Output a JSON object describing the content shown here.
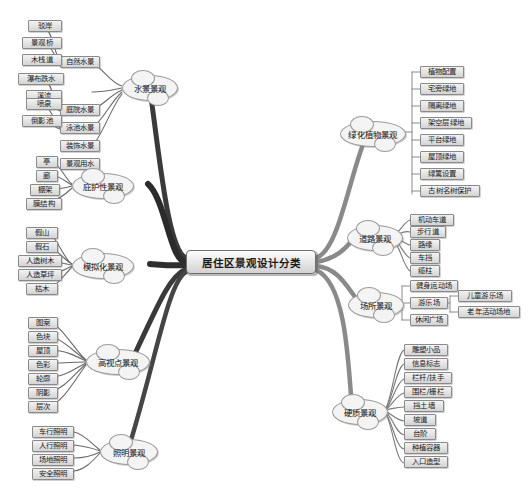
{
  "diagram": {
    "title": "居住区景观设计分类",
    "type": "mind-map",
    "colors": {
      "background": "#ffffff",
      "node_fill": "#e6e6e6",
      "node_border": "#8a8a8a",
      "branch_stroke": "#555555",
      "central_fill": "#e8e8e8"
    }
  },
  "central": {
    "label": "居住区景观设计分类"
  },
  "branches": {
    "water": {
      "label": "水景景观",
      "children": [
        {
          "label": "自然水景",
          "children": [
            {
              "label": "驳岸"
            },
            {
              "label": "景观桥"
            },
            {
              "label": "木栈道"
            }
          ]
        },
        {
          "label": "庭院水景",
          "children": [
            {
              "label": "瀑布跌水"
            },
            {
              "label": "溪流"
            }
          ]
        },
        {
          "label": "泳池水景",
          "children": []
        },
        {
          "label": "装饰水景",
          "children": [
            {
              "label": "喷泉"
            },
            {
              "label": "倒影池"
            }
          ]
        },
        {
          "label": "景观用水",
          "children": []
        }
      ]
    },
    "shelter": {
      "label": "庇护性景观",
      "children": [
        {
          "label": "亭"
        },
        {
          "label": "廊"
        },
        {
          "label": "棚架"
        },
        {
          "label": "膜结构"
        }
      ]
    },
    "simulation": {
      "label": "模拟化景观",
      "children": [
        {
          "label": "假山"
        },
        {
          "label": "假石"
        },
        {
          "label": "人造树木"
        },
        {
          "label": "人造草坪"
        },
        {
          "label": "枯木"
        }
      ]
    },
    "highview": {
      "label": "高视点景观",
      "children": [
        {
          "label": "图案"
        },
        {
          "label": "色块"
        },
        {
          "label": "屋顶"
        },
        {
          "label": "色彩"
        },
        {
          "label": "轮廓"
        },
        {
          "label": "阴影"
        },
        {
          "label": "层次"
        }
      ]
    },
    "lighting": {
      "label": "照明景观",
      "children": [
        {
          "label": "车行照明"
        },
        {
          "label": "人行照明"
        },
        {
          "label": "场地照明"
        },
        {
          "label": "安全照明"
        }
      ]
    },
    "planting": {
      "label": "绿化植物景观",
      "children": [
        {
          "label": "植物配置"
        },
        {
          "label": "宅旁绿地"
        },
        {
          "label": "隔离绿地"
        },
        {
          "label": "架空层绿地"
        },
        {
          "label": "平台绿地"
        },
        {
          "label": "屋顶绿地"
        },
        {
          "label": "绿篱设置"
        },
        {
          "label": "古树名树保护"
        }
      ]
    },
    "road": {
      "label": "道路景观",
      "children": [
        {
          "label": "机动车道"
        },
        {
          "label": "步行道"
        },
        {
          "label": "路缘"
        },
        {
          "label": "车挡"
        },
        {
          "label": "缆柱"
        }
      ]
    },
    "place": {
      "label": "场所景观",
      "children": [
        {
          "label": "健身运动场",
          "children": []
        },
        {
          "label": "游乐场",
          "children": [
            {
              "label": "儿童游乐场"
            },
            {
              "label": "老年活动场地"
            }
          ]
        },
        {
          "label": "休闲广场",
          "children": []
        }
      ]
    },
    "hardscape": {
      "label": "硬质景观",
      "children": [
        {
          "label": "雕塑小品"
        },
        {
          "label": "信息标志"
        },
        {
          "label": "栏杆/扶手"
        },
        {
          "label": "围栏/栅栏"
        },
        {
          "label": "挡土墙"
        },
        {
          "label": "坡道"
        },
        {
          "label": "台阶"
        },
        {
          "label": "种植容器"
        },
        {
          "label": "入口造型"
        }
      ]
    }
  }
}
